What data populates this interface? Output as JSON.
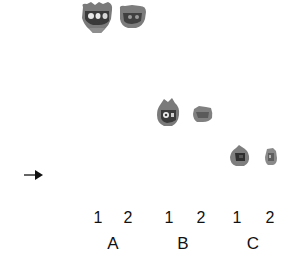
{
  "figure": {
    "type": "gel/blot autoradiograph",
    "background_color": "#ffffff",
    "spot_color": "#6e6e6e",
    "spot_dark_color": "#2a2a2a"
  },
  "marker": {
    "icon": "arrow-right-icon",
    "glyph": "→"
  },
  "lanes": [
    {
      "label": "1",
      "group": "A"
    },
    {
      "label": "2",
      "group": "A"
    },
    {
      "label": "1",
      "group": "B"
    },
    {
      "label": "2",
      "group": "B"
    },
    {
      "label": "1",
      "group": "C"
    },
    {
      "label": "2",
      "group": "C"
    }
  ],
  "groups": [
    "A",
    "B",
    "C"
  ]
}
